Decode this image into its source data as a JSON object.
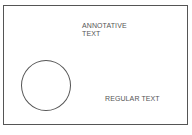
{
  "diagram": {
    "annotative_text": {
      "line1": "ANNOTATIVE",
      "line2": "TEXT"
    },
    "regular_text": "REGULAR TEXT",
    "shapes": [
      {
        "type": "rectangle",
        "role": "frame"
      },
      {
        "type": "circle"
      }
    ],
    "colors": {
      "stroke": "#555555",
      "background": "#ffffff"
    }
  }
}
